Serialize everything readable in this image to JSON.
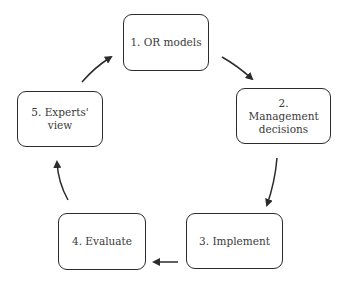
{
  "diagram": {
    "type": "cycle",
    "nodes": [
      {
        "id": "n1",
        "label": "1. OR models"
      },
      {
        "id": "n2",
        "label": "2. Management decisions"
      },
      {
        "id": "n3",
        "label": "3. Implement"
      },
      {
        "id": "n4",
        "label": "4. Evaluate"
      },
      {
        "id": "n5",
        "label": "5. Experts' view"
      }
    ],
    "edges": [
      {
        "from": "n1",
        "to": "n2"
      },
      {
        "from": "n2",
        "to": "n3"
      },
      {
        "from": "n3",
        "to": "n4"
      },
      {
        "from": "n4",
        "to": "n5"
      },
      {
        "from": "n5",
        "to": "n1"
      }
    ],
    "colors": {
      "stroke": "#2b2b2b",
      "text": "#3a3a3a",
      "background": "#ffffff"
    }
  }
}
